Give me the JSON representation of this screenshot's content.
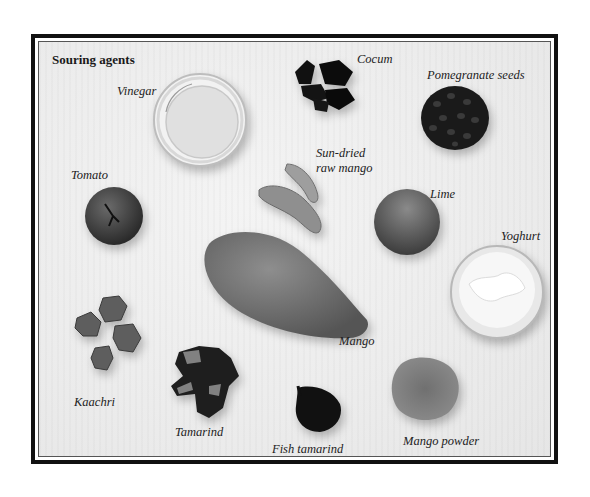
{
  "plate": {
    "title": "Souring agents",
    "border_color": "#111111",
    "background_color": "#ececec"
  },
  "labels": {
    "vinegar": "Vinegar",
    "cocum": "Cocum",
    "pomegranate_seeds": "Pomegranate seeds",
    "tomato": "Tomato",
    "sun_dried_line1": "Sun-dried",
    "sun_dried_line2": "raw mango",
    "lime": "Lime",
    "yoghurt": "Yoghurt",
    "mango": "Mango",
    "kaachri": "Kaachri",
    "tamarind": "Tamarind",
    "fish_tamarind": "Fish tamarind",
    "mango_powder": "Mango powder"
  }
}
